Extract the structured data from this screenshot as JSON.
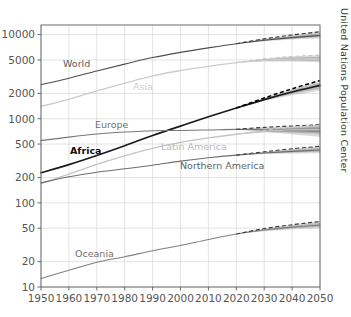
{
  "credit": "United Nations Population Center",
  "chart_data": {
    "type": "line",
    "title": "",
    "xlabel": "",
    "ylabel": "",
    "yscale": "log",
    "ylim": [
      10,
      13000
    ],
    "xlim": [
      1950,
      2050
    ],
    "grid": true,
    "legend_position": "inline-labels",
    "ytick_labels": [
      "10000",
      "5000",
      "2000",
      "1000",
      "500",
      "200",
      "100",
      "50",
      "20",
      "10"
    ],
    "ytick_values": [
      10000,
      5000,
      2000,
      1000,
      500,
      200,
      100,
      50,
      20,
      10
    ],
    "xtick_labels": [
      "1950",
      "1960",
      "1970",
      "1980",
      "1990",
      "2000",
      "2010",
      "2020",
      "2030",
      "2040",
      "2050"
    ],
    "xtick_values": [
      1950,
      1960,
      1970,
      1980,
      1990,
      2000,
      2010,
      2020,
      2030,
      2040,
      2050
    ],
    "units": "millions of people",
    "x": [
      1950,
      1960,
      1970,
      1980,
      1990,
      2000,
      2010,
      2020,
      2030,
      2040,
      2050
    ],
    "series": [
      {
        "name": "World",
        "label": "World",
        "color": "#4d4d4d",
        "emphasis": "normal",
        "values": [
          2536,
          3035,
          3700,
          4458,
          5331,
          6145,
          6957,
          7795,
          8548,
          9199,
          9735
        ],
        "projection_from": 2020,
        "upper_95": [
          null,
          null,
          null,
          null,
          null,
          null,
          null,
          7795,
          8900,
          9900,
          10800
        ],
        "lower_95": [
          null,
          null,
          null,
          null,
          null,
          null,
          null,
          7795,
          8350,
          8750,
          9000
        ]
      },
      {
        "name": "Asia",
        "label": "Asia",
        "color": "#cccccc",
        "emphasis": "faint",
        "values": [
          1405,
          1700,
          2142,
          2642,
          3226,
          3741,
          4194,
          4641,
          4947,
          5100,
          5129
        ],
        "projection_from": 2020,
        "upper_95": [
          null,
          null,
          null,
          null,
          null,
          null,
          null,
          4641,
          5150,
          5500,
          5700
        ],
        "lower_95": [
          null,
          null,
          null,
          null,
          null,
          null,
          null,
          4641,
          4800,
          4800,
          4700
        ]
      },
      {
        "name": "Africa",
        "label": "Africa",
        "color": "#1a1a1a",
        "emphasis": "bold",
        "values": [
          228,
          285,
          366,
          478,
          632,
          818,
          1055,
          1341,
          1688,
          2077,
          2489
        ],
        "projection_from": 2020,
        "upper_95": [
          null,
          null,
          null,
          null,
          null,
          null,
          null,
          1341,
          1760,
          2270,
          2850
        ],
        "lower_95": [
          null,
          null,
          null,
          null,
          null,
          null,
          null,
          1341,
          1630,
          1900,
          2150
        ]
      },
      {
        "name": "Europe",
        "label": "Europe",
        "color": "#777777",
        "emphasis": "normal",
        "values": [
          549,
          605,
          657,
          694,
          721,
          726,
          736,
          748,
          741,
          724,
          710
        ],
        "projection_from": 2020,
        "upper_95": [
          null,
          null,
          null,
          null,
          null,
          null,
          null,
          748,
          790,
          820,
          850
        ],
        "lower_95": [
          null,
          null,
          null,
          null,
          null,
          null,
          null,
          748,
          700,
          650,
          610
        ]
      },
      {
        "name": "Latin America",
        "label": "Latin America",
        "color": "#c4c4c4",
        "emphasis": "faint",
        "values": [
          169,
          220,
          287,
          362,
          443,
          522,
          591,
          654,
          706,
          735,
          744
        ],
        "projection_from": 2020,
        "upper_95": [
          null,
          null,
          null,
          null,
          null,
          null,
          null,
          654,
          730,
          790,
          830
        ],
        "lower_95": [
          null,
          null,
          null,
          null,
          null,
          null,
          null,
          654,
          685,
          690,
          680
        ]
      },
      {
        "name": "Northern America",
        "label": "Northern America",
        "color": "#6e6e6e",
        "emphasis": "normal",
        "values": [
          173,
          204,
          231,
          254,
          280,
          313,
          343,
          369,
          391,
          409,
          425
        ],
        "projection_from": 2020,
        "upper_95": [
          null,
          null,
          null,
          null,
          null,
          null,
          null,
          369,
          405,
          440,
          470
        ],
        "lower_95": [
          null,
          null,
          null,
          null,
          null,
          null,
          null,
          369,
          380,
          385,
          390
        ]
      },
      {
        "name": "Oceania",
        "label": "Oceania",
        "color": "#808080",
        "emphasis": "normal",
        "values": [
          12.6,
          15.8,
          19.7,
          22.9,
          27.0,
          31.2,
          36.7,
          42.7,
          47.6,
          51.5,
          54.4
        ],
        "projection_from": 2020,
        "upper_95": [
          null,
          null,
          null,
          null,
          null,
          null,
          null,
          42.7,
          49.5,
          55.0,
          60.0
        ],
        "lower_95": [
          null,
          null,
          null,
          null,
          null,
          null,
          null,
          42.7,
          46.0,
          48.5,
          50.0
        ]
      }
    ],
    "inline_labels": [
      {
        "name": "World",
        "text": "World",
        "x_px": 63,
        "y_px": 67,
        "color": "#5a5a5a",
        "weight": "normal"
      },
      {
        "name": "Asia",
        "text": "Asia",
        "x_px": 133,
        "y_px": 90,
        "color": "#d0d0d0",
        "weight": "normal"
      },
      {
        "name": "Europe",
        "text": "Europe",
        "x_px": 95,
        "y_px": 128,
        "color": "#6f6f6f",
        "weight": "normal"
      },
      {
        "name": "Africa",
        "text": "Africa",
        "x_px": 70,
        "y_px": 154,
        "color": "#111111",
        "weight": "bold"
      },
      {
        "name": "Latin America",
        "text": "Latin America",
        "x_px": 161,
        "y_px": 150,
        "color": "#b9b9b9",
        "weight": "normal"
      },
      {
        "name": "Northern America",
        "text": "Northern America",
        "x_px": 180,
        "y_px": 169,
        "color": "#5f5f5f",
        "weight": "normal"
      },
      {
        "name": "Oceania",
        "text": "Oceania",
        "x_px": 75,
        "y_px": 257,
        "color": "#6f6f6f",
        "weight": "normal"
      }
    ]
  }
}
